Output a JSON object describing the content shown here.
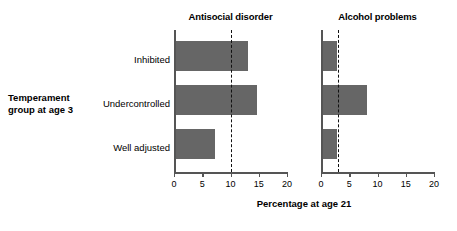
{
  "chart_data": {
    "type": "bar",
    "orientation": "horizontal",
    "title": "",
    "xlabel": "Percentage at age 21",
    "ylabel": "Temperament group at age 3",
    "categories": [
      "Inhibited",
      "Undercontrolled",
      "Well adjusted"
    ],
    "xlim": [
      0,
      20
    ],
    "xticks": [
      0,
      5,
      10,
      15,
      20
    ],
    "xticklabels": [
      "0",
      "5",
      "10",
      "15",
      "20"
    ],
    "grid": false,
    "legend": "none",
    "bar_color": "#666666",
    "axis_color": "#555555",
    "panels": [
      {
        "name": "antisocial-disorder",
        "title": "Antisocial disorder",
        "values": [
          13.0,
          14.5,
          7.0
        ],
        "reference_line": 10.0
      },
      {
        "name": "alcohol-problems",
        "title": "Alcohol problems",
        "values": [
          2.6,
          8.0,
          2.6
        ],
        "reference_line": 3.0
      }
    ]
  },
  "labels": {
    "group_axis_title_line1": "Temperament",
    "group_axis_title_line2": "group at age 3",
    "x_caption": "Percentage at age 21"
  }
}
